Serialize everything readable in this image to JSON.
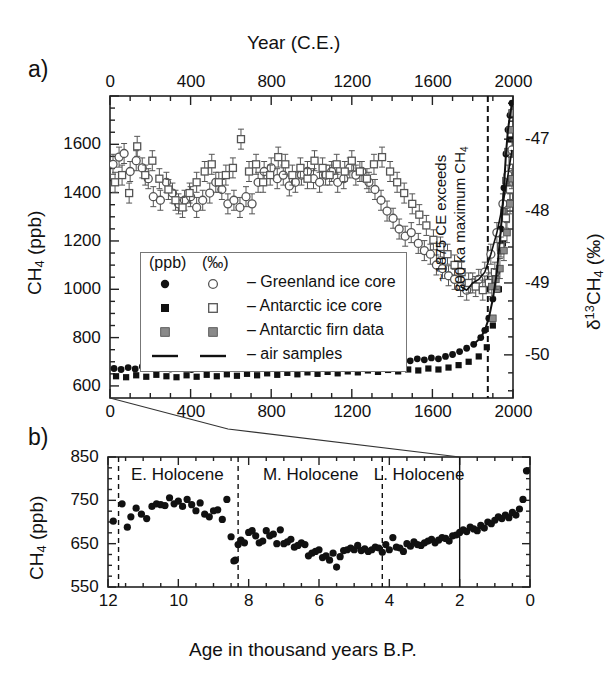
{
  "figure": {
    "panel_a_letter": "a)",
    "panel_b_letter": "b)"
  },
  "panel_a": {
    "top_axis_title": "Year (C.E.)",
    "top_ticks": [
      "0",
      "400",
      "800",
      "1200",
      "1600",
      "2000"
    ],
    "bottom_ticks": [
      "0",
      "400",
      "800",
      "1200",
      "1600",
      "2000"
    ],
    "left_axis_title_main": "CH",
    "left_axis_title_sub": "4",
    "left_axis_title_unit": " (ppb)",
    "left_ticks": [
      "1600",
      "1400",
      "1200",
      "1000",
      "800",
      "600"
    ],
    "right_axis_title_delta": "δ",
    "right_axis_title_sup": "13",
    "right_axis_title_ch": "CH",
    "right_axis_title_sub": "4",
    "right_axis_title_unit": " (‰)",
    "right_ticks": [
      "-47",
      "-48",
      "-49",
      "-50"
    ],
    "annotation_line1": "~1875 CE exceeds",
    "annotation_line2_pre": "800 ka maximum CH",
    "annotation_line2_sub": "4",
    "legend": {
      "header_ppb": "(ppb)",
      "header_permil": "(‰)",
      "rows": [
        {
          "label": "– Greenland ice core",
          "marker_filled": "circle-filled",
          "marker_open": "circle-open"
        },
        {
          "label": "– Antarctic ice core",
          "marker_filled": "square-filled",
          "marker_open": "square-open"
        },
        {
          "label": "– Antarctic firn data",
          "marker_filled": "square-gray",
          "marker_open": "square-gray-outline"
        },
        {
          "label": "– air samples",
          "marker_filled": "line",
          "marker_open": "line"
        }
      ]
    }
  },
  "panel_b": {
    "left_axis_title_main": "CH",
    "left_axis_title_sub": "4",
    "left_axis_title_unit": " (ppb)",
    "left_ticks": [
      "850",
      "750",
      "650",
      "550"
    ],
    "x_axis_title": "Age in thousand years B.P.",
    "x_ticks": [
      "12",
      "10",
      "8",
      "6",
      "4",
      "2",
      "0"
    ],
    "epochs": [
      "E. Holocene",
      "M. Holocene",
      "L. Holocene"
    ]
  },
  "colors": {
    "ink": "#111111",
    "axis": "#222222",
    "gray_marker": "#8a8a8a",
    "open_marker_edge": "#555555",
    "legend_border": "#777777"
  },
  "chart_data": {
    "type": "scatter",
    "charts": [
      {
        "id": "panel-a",
        "type": "scatter",
        "title": "Year (C.E.)",
        "xlabel": "Year (C.E.)",
        "ylabel": "CH4 (ppb)",
        "ylabel_right": "d13CH4 (permil)",
        "xlim": [
          0,
          2000
        ],
        "ylim": [
          550,
          1800
        ],
        "ylim_right": [
          -50.6,
          -46.4
        ],
        "grid": false,
        "annotations": [
          {
            "text": "~1875 CE exceeds 800 ka maximum CH4",
            "x": 1875,
            "type": "vertical-dashed-line"
          }
        ],
        "series": [
          {
            "name": "Greenland ice core CH4 (ppb)",
            "marker": "circle-filled",
            "axis": "left",
            "x": [
              20,
              55,
              90,
              125,
              160,
              195,
              230,
              265,
              300,
              335,
              370,
              405,
              440,
              475,
              510,
              545,
              580,
              615,
              650,
              685,
              720,
              755,
              790,
              825,
              860,
              895,
              930,
              965,
              1000,
              1035,
              1070,
              1105,
              1140,
              1175,
              1210,
              1245,
              1280,
              1315,
              1350,
              1385,
              1420,
              1455,
              1490,
              1525,
              1560,
              1595,
              1630,
              1665,
              1700,
              1735,
              1770,
              1805,
              1840,
              1860,
              1880,
              1900,
              1920,
              1940,
              1955,
              1965,
              1975,
              1985,
              1995
            ],
            "y": [
              672,
              668,
              676,
              670,
              680,
              674,
              666,
              678,
              670,
              682,
              676,
              668,
              674,
              680,
              672,
              678,
              686,
              680,
              672,
              684,
              678,
              686,
              680,
              674,
              688,
              682,
              690,
              684,
              678,
              690,
              686,
              694,
              688,
              696,
              690,
              700,
              694,
              702,
              698,
              706,
              700,
              708,
              704,
              712,
              708,
              716,
              712,
              722,
              730,
              742,
              756,
              772,
              800,
              830,
              880,
              960,
              1070,
              1250,
              1420,
              1560,
              1660,
              1720,
              1770
            ]
          },
          {
            "name": "Antarctic ice core CH4 (ppb)",
            "marker": "square-filled",
            "axis": "left",
            "x": [
              30,
              80,
              130,
              180,
              230,
              280,
              330,
              380,
              430,
              480,
              530,
              580,
              630,
              680,
              730,
              780,
              830,
              880,
              930,
              980,
              1030,
              1080,
              1130,
              1180,
              1230,
              1280,
              1330,
              1380,
              1430,
              1480,
              1530,
              1580,
              1630,
              1680,
              1730,
              1780,
              1830,
              1870,
              1900,
              1930,
              1950,
              1970,
              1990
            ],
            "y": [
              640,
              636,
              644,
              638,
              646,
              640,
              636,
              644,
              638,
              646,
              640,
              648,
              642,
              650,
              644,
              652,
              646,
              654,
              648,
              656,
              650,
              658,
              652,
              660,
              656,
              664,
              658,
              666,
              660,
              668,
              664,
              672,
              668,
              676,
              686,
              700,
              722,
              760,
              850,
              1000,
              1190,
              1420,
              1620
            ]
          },
          {
            "name": "Antarctic firn data CH4 (ppb)",
            "marker": "square-gray",
            "axis": "left",
            "x": [
              1900,
              1920,
              1940,
              1955,
              1965,
              1975,
              1985,
              1995
            ],
            "y": [
              880,
              1000,
              1160,
              1320,
              1450,
              1570,
              1660,
              1730
            ]
          },
          {
            "name": "Greenland ice core d13CH4 (permil)",
            "marker": "circle-open",
            "axis": "right",
            "x": [
              15,
              45,
              70,
              100,
              130,
              160,
              190,
              215,
              250,
              280,
              310,
              340,
              370,
              400,
              430,
              460,
              495,
              525,
              555,
              585,
              615,
              645,
              675,
              705,
              735,
              765,
              800,
              830,
              860,
              890,
              920,
              950,
              980,
              1010,
              1040,
              1070,
              1100,
              1130,
              1160,
              1190,
              1220,
              1250,
              1285,
              1315,
              1345,
              1375,
              1405,
              1435,
              1465,
              1495,
              1530,
              1560,
              1590,
              1620,
              1650,
              1680,
              1710,
              1740,
              1770,
              1800,
              1830,
              1860,
              1890,
              1920,
              1950,
              1975,
              1995
            ],
            "y": [
              -47.35,
              -47.25,
              -47.2,
              -47.45,
              -47.3,
              -47.4,
              -47.55,
              -47.8,
              -47.85,
              -47.6,
              -47.75,
              -47.9,
              -47.85,
              -47.8,
              -47.95,
              -47.85,
              -47.75,
              -47.6,
              -47.7,
              -47.9,
              -47.85,
              -47.95,
              -47.8,
              -47.9,
              -47.6,
              -47.45,
              -47.4,
              -47.55,
              -47.5,
              -47.65,
              -47.6,
              -47.5,
              -47.45,
              -47.55,
              -47.6,
              -47.5,
              -47.45,
              -47.6,
              -47.55,
              -47.4,
              -47.5,
              -47.45,
              -47.6,
              -47.7,
              -47.85,
              -48.0,
              -48.1,
              -48.25,
              -48.35,
              -48.3,
              -48.45,
              -48.55,
              -48.6,
              -48.75,
              -48.8,
              -48.9,
              -48.95,
              -49.05,
              -49.1,
              -49.0,
              -48.95,
              -48.85,
              -48.6,
              -48.3,
              -47.9,
              -47.5,
              -47.15
            ]
          },
          {
            "name": "Antarctic ice core d13CH4 (permil)",
            "marker": "square-open",
            "axis": "right",
            "x": [
              25,
              60,
              95,
              135,
              175,
              210,
              245,
              290,
              325,
              360,
              395,
              430,
              470,
              505,
              540,
              575,
              610,
              650,
              690,
              725,
              760,
              795,
              835,
              870,
              905,
              945,
              980,
              1015,
              1055,
              1090,
              1125,
              1165,
              1200,
              1240,
              1275,
              1310,
              1350,
              1390,
              1425,
              1460,
              1500,
              1535,
              1570,
              1605,
              1640,
              1675,
              1710,
              1745,
              1780,
              1815,
              1850,
              1880,
              1910,
              1940,
              1965,
              1985,
              1998
            ],
            "y": [
              -47.6,
              -47.5,
              -47.75,
              -47.1,
              -47.5,
              -47.3,
              -47.55,
              -47.7,
              -47.85,
              -47.95,
              -47.75,
              -47.6,
              -47.45,
              -47.35,
              -47.6,
              -47.5,
              -47.4,
              -47.0,
              -47.45,
              -47.35,
              -47.6,
              -47.5,
              -47.25,
              -47.35,
              -47.5,
              -47.4,
              -47.55,
              -47.3,
              -47.4,
              -47.5,
              -47.35,
              -47.45,
              -47.3,
              -47.45,
              -47.55,
              -47.35,
              -47.25,
              -47.45,
              -47.6,
              -47.75,
              -47.9,
              -48.05,
              -48.2,
              -48.4,
              -48.5,
              -48.6,
              -48.75,
              -48.85,
              -49.0,
              -49.05,
              -49.1,
              -49.0,
              -48.85,
              -48.5,
              -48.1,
              -47.7,
              -47.3
            ]
          },
          {
            "name": "Antarctic firn data d13CH4 (permil)",
            "marker": "square-gray",
            "axis": "right",
            "x": [
              1895,
              1915,
              1935,
              1955,
              1970,
              1985,
              1995
            ],
            "y": [
              -49.05,
              -48.95,
              -48.8,
              -48.55,
              -48.3,
              -47.9,
              -47.55
            ]
          }
        ]
      },
      {
        "id": "panel-b",
        "type": "scatter",
        "title": "",
        "xlabel": "Age in thousand years B.P.",
        "ylabel": "CH4 (ppb)",
        "xlim": [
          12,
          0
        ],
        "ylim": [
          550,
          850
        ],
        "grid": false,
        "x_reversed": true,
        "epoch_dividers": [
          11.7,
          8.3,
          4.2,
          2.0
        ],
        "series": [
          {
            "name": "Holocene CH4 (ppb)",
            "marker": "circle-filled",
            "x": [
              11.85,
              11.6,
              11.45,
              11.35,
              11.2,
              11.05,
              10.9,
              10.75,
              10.62,
              10.5,
              10.38,
              10.25,
              10.12,
              10.0,
              9.88,
              9.75,
              9.62,
              9.5,
              9.38,
              9.25,
              9.12,
              9.0,
              8.88,
              8.75,
              8.62,
              8.5,
              8.42,
              8.38,
              8.3,
              8.22,
              8.12,
              8.0,
              7.9,
              7.8,
              7.7,
              7.6,
              7.5,
              7.4,
              7.3,
              7.2,
              7.1,
              7.0,
              6.9,
              6.8,
              6.7,
              6.6,
              6.5,
              6.4,
              6.3,
              6.2,
              6.1,
              6.0,
              5.9,
              5.8,
              5.7,
              5.6,
              5.5,
              5.4,
              5.3,
              5.2,
              5.1,
              5.0,
              4.9,
              4.8,
              4.7,
              4.6,
              4.5,
              4.4,
              4.3,
              4.2,
              4.1,
              4.0,
              3.9,
              3.8,
              3.7,
              3.6,
              3.5,
              3.4,
              3.3,
              3.2,
              3.1,
              3.0,
              2.9,
              2.8,
              2.7,
              2.6,
              2.5,
              2.4,
              2.3,
              2.2,
              2.1,
              2.0,
              1.9,
              1.8,
              1.7,
              1.6,
              1.5,
              1.4,
              1.3,
              1.2,
              1.1,
              1.0,
              0.9,
              0.8,
              0.7,
              0.6,
              0.5,
              0.4,
              0.3,
              0.2,
              0.1
            ],
            "y": [
              702,
              742,
              688,
              712,
              732,
              718,
              708,
              736,
              742,
              740,
              738,
              756,
              742,
              748,
              736,
              752,
              740,
              726,
              744,
              718,
              712,
              726,
              728,
              706,
              752,
              666,
              610,
              612,
              648,
              658,
              652,
              676,
              680,
              668,
              652,
              656,
              680,
              668,
              672,
              650,
              682,
              650,
              654,
              660,
              642,
              646,
              652,
              648,
              622,
              628,
              632,
              636,
              618,
              622,
              612,
              628,
              596,
              620,
              634,
              636,
              640,
              636,
              646,
              634,
              638,
              632,
              636,
              642,
              640,
              630,
              648,
              636,
              664,
              642,
              640,
              632,
              650,
              644,
              654,
              648,
              646,
              652,
              656,
              660,
              652,
              658,
              664,
              662,
              656,
              668,
              670,
              676,
              682,
              678,
              688,
              684,
              680,
              692,
              686,
              700,
              696,
              704,
              712,
              708,
              716,
              710,
              722,
              716,
              730,
              752,
              818
            ]
          }
        ]
      }
    ]
  }
}
